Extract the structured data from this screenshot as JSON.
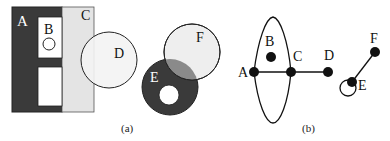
{
  "figure": {
    "panel_a": {
      "caption": "(a)",
      "regions": [
        {
          "id": "A",
          "label": "A",
          "shape": "rectangle",
          "fill": "#3a3a3a"
        },
        {
          "id": "B",
          "label": "B",
          "shape": "rectangle",
          "fill": "#ffffff"
        },
        {
          "id": "C",
          "label": "C",
          "shape": "rectangle",
          "fill": "#e4e4e4"
        },
        {
          "id": "D",
          "label": "D",
          "shape": "circle",
          "fill": "#f0f0f0"
        },
        {
          "id": "E",
          "label": "E",
          "shape": "circle",
          "fill": "#3a3a3a"
        },
        {
          "id": "F",
          "label": "F",
          "shape": "circle",
          "fill": "#eeeeee"
        }
      ],
      "overlap_EF_fill": "#8a8a8a"
    },
    "panel_b": {
      "caption": "(b)",
      "nodes": [
        {
          "id": "A",
          "label": "A"
        },
        {
          "id": "B",
          "label": "B"
        },
        {
          "id": "C",
          "label": "C"
        },
        {
          "id": "D",
          "label": "D"
        },
        {
          "id": "E",
          "label": "E"
        },
        {
          "id": "F",
          "label": "F"
        }
      ],
      "edges": [
        {
          "from": "A",
          "to": "C",
          "type": "line"
        },
        {
          "from": "C",
          "to": "D",
          "type": "line"
        },
        {
          "from": "A",
          "to": "C",
          "type": "arc-upper"
        },
        {
          "from": "A",
          "to": "C",
          "type": "arc-lower"
        },
        {
          "from": "E",
          "to": "F",
          "type": "line"
        },
        {
          "from": "E",
          "to": "E",
          "type": "self-loop"
        }
      ]
    }
  }
}
